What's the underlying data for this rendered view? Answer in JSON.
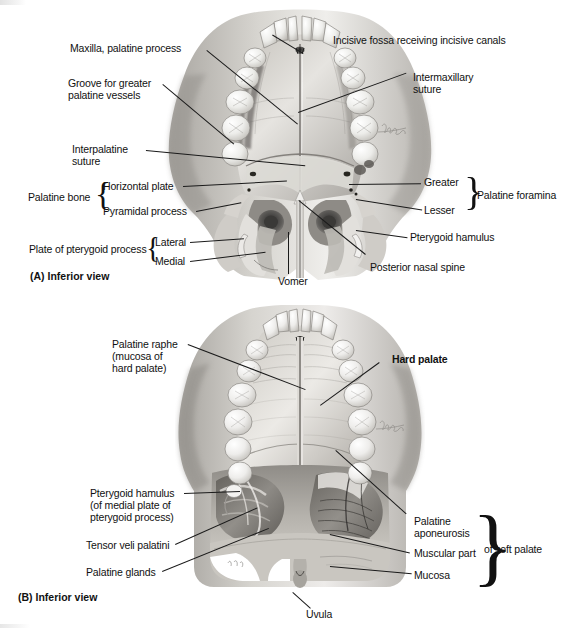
{
  "figure": {
    "background_color": "#ffffff",
    "line_color": "#1a1a1a",
    "text_color": "#111111"
  },
  "panel_a": {
    "caption": "(A) Inferior view",
    "subject": "Bony palate of the skull, inferior view",
    "labels": {
      "maxilla_palatine_process": "Maxilla, palatine process",
      "groove_line1": "Groove for greater",
      "groove_line2": "palatine vessels",
      "interpalatine_line1": "Interpalatine",
      "interpalatine_line2": "suture",
      "palatine_bone": "Palatine bone",
      "horizontal_plate": "Horizontal plate",
      "pyramidal_process": "Pyramidal process",
      "plate_of_pterygoid_process": "Plate of pterygoid process",
      "lateral": "Lateral",
      "medial": "Medial",
      "incisive_fossa": "Incisive fossa receiving incisive canals",
      "intermaxillary_line1": "Intermaxillary",
      "intermaxillary_line2": "suture",
      "greater": "Greater",
      "lesser": "Lesser",
      "palatine_foramina": "Palatine foramina",
      "pterygoid_hamulus": "Pterygoid hamulus",
      "posterior_nasal_spine": "Posterior nasal spine",
      "vomer": "Vomer"
    },
    "braces": {
      "palatine_bone_group": [
        "Horizontal plate",
        "Pyramidal process"
      ],
      "pterygoid_plate_group": [
        "Lateral",
        "Medial"
      ],
      "palatine_foramina_group": [
        "Greater",
        "Lesser"
      ]
    }
  },
  "panel_b": {
    "caption": "(B) Inferior view",
    "subject": "Hard and soft palate with mucosa and muscles, inferior view",
    "labels": {
      "palatine_raphe_line1": "Palatine raphe",
      "palatine_raphe_line2": "(mucosa of",
      "palatine_raphe_line3": "hard palate)",
      "hard_palate": "Hard palate",
      "pterygoid_hamulus_line1": "Pterygoid hamulus",
      "pterygoid_hamulus_line2": "(of medial plate of",
      "pterygoid_hamulus_line3": "pterygoid process)",
      "tensor_veli_palatini": "Tensor veli palatini",
      "palatine_glands": "Palatine glands",
      "palatine_aponeurosis_line1": "Palatine",
      "palatine_aponeurosis_line2": "aponeurosis",
      "muscular_part": "Muscular part",
      "mucosa": "Mucosa",
      "of_soft_palate_prefix": "of ",
      "of_soft_palate_bold": "soft palate",
      "uvula": "Uvula"
    },
    "braces": {
      "soft_palate_group": [
        "Palatine aponeurosis",
        "Muscular part",
        "Mucosa"
      ]
    }
  },
  "artist_signature": "illustrator signature"
}
